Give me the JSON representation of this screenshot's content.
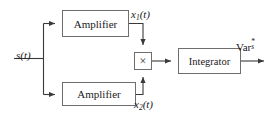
{
  "diagram": {
    "background_color": "#ffffff",
    "line_color": "#3a3a3a",
    "box_border_color": "#6e6e6e",
    "text_color": "#1a1a1a",
    "blocks": {
      "amplifier_top": "Amplifier",
      "amplifier_bottom": "Amplifier",
      "integrator": "Integrator",
      "multiplier": "×"
    },
    "labels": {
      "input": "s(t)",
      "input_base": "s",
      "input_arg": "(t)",
      "branch_top": "x₁(t)",
      "branch_top_base": "x",
      "branch_top_sub": "1",
      "branch_top_arg": "(t)",
      "branch_bottom": "x₂(t)",
      "branch_bottom_base": "x",
      "branch_bottom_sub": "2",
      "branch_bottom_arg": "(t)",
      "output": "Var*ₛ",
      "output_base": "Var",
      "output_sup": "*",
      "output_sub": "s"
    }
  }
}
